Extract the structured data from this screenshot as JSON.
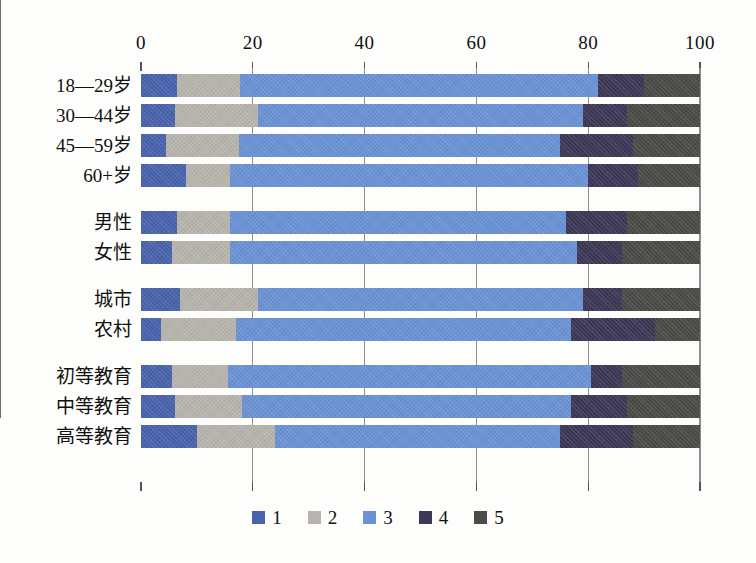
{
  "chart_data": {
    "type": "bar",
    "orientation": "horizontal",
    "stacked": true,
    "percent": true,
    "title": "",
    "subtitle": "",
    "xlabel": "",
    "ylabel": "",
    "xlim": [
      0,
      100
    ],
    "xticks": [
      0,
      20,
      40,
      60,
      80,
      100
    ],
    "xtick_labels": [
      "0",
      "20",
      "40",
      "60",
      "80",
      "100"
    ],
    "grid": true,
    "grid_axis": "x",
    "legend_position": "bottom",
    "legend": [
      "1",
      "2",
      "3",
      "4",
      "5"
    ],
    "series": [
      {
        "name": "1",
        "color": "#4a63ad",
        "values": [
          6.5,
          6.0,
          4.5,
          8.0,
          6.5,
          5.5,
          7.0,
          3.5,
          5.5,
          6.0,
          10.0
        ]
      },
      {
        "name": "2",
        "color": "#b6b4ac",
        "values": [
          11.2,
          15.0,
          13.0,
          8.0,
          9.5,
          10.5,
          14.0,
          13.5,
          10.0,
          12.0,
          14.0
        ]
      },
      {
        "name": "3",
        "color": "#6b92d4",
        "values": [
          64.0,
          58.0,
          57.5,
          64.0,
          60.0,
          62.0,
          58.0,
          60.0,
          65.0,
          59.0,
          51.0
        ]
      },
      {
        "name": "4",
        "color": "#3e3857",
        "values": [
          8.3,
          8.0,
          13.0,
          9.0,
          11.0,
          8.0,
          7.0,
          15.0,
          5.5,
          10.0,
          13.0
        ]
      },
      {
        "name": "5",
        "color": "#4b4b47",
        "values": [
          10.0,
          13.0,
          12.0,
          11.0,
          13.0,
          14.0,
          14.0,
          8.0,
          14.0,
          13.0,
          12.0
        ]
      }
    ],
    "categories": [
      "18—29岁",
      "30—44岁",
      "45—59岁",
      "60+岁",
      "男性",
      "女性",
      "城市",
      "农村",
      "初等教育",
      "中等教育",
      "高等教育"
    ],
    "category_groups": [
      {
        "name": "age",
        "members": [
          "18—29岁",
          "30—44岁",
          "45—59岁",
          "60+岁"
        ]
      },
      {
        "name": "gender",
        "members": [
          "男性",
          "女性"
        ]
      },
      {
        "name": "residence",
        "members": [
          "城市",
          "农村"
        ]
      },
      {
        "name": "education",
        "members": [
          "初等教育",
          "中等教育",
          "高等教育"
        ]
      }
    ]
  },
  "colors": {
    "series_1": "#4a63ad",
    "series_2": "#b6b4ac",
    "series_3": "#6b92d4",
    "series_4": "#3e3857",
    "series_5": "#4b4b47",
    "axis": "#6e6e6e",
    "grid": "#8e8e8e",
    "text": "#111111",
    "background": "#fdfdfb"
  }
}
